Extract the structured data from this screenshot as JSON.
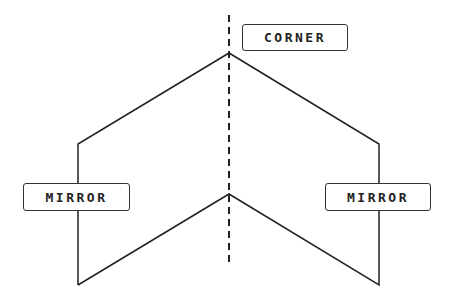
{
  "diagram": {
    "labels": {
      "corner": "CORNER",
      "mirror_left": "MIRROR",
      "mirror_right": "MIRROR"
    },
    "colors": {
      "stroke": "#222222",
      "background": "#ffffff"
    }
  }
}
